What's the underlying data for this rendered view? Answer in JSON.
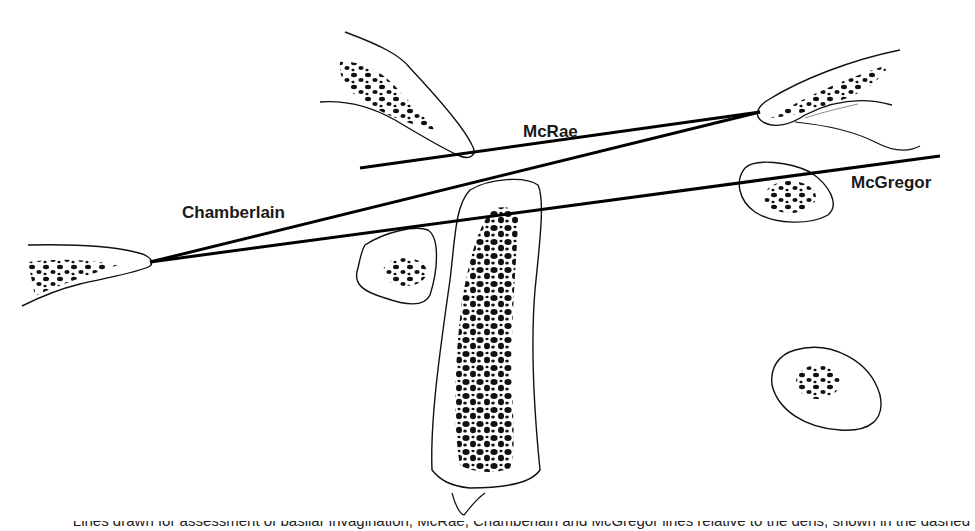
{
  "figure": {
    "type": "anatomical line diagram",
    "colors": {
      "ink": "#111111",
      "background": "#ffffff"
    }
  },
  "labels": {
    "mcrae": "McRae",
    "chamberlain": "Chamberlain",
    "mcgregor": "McGregor"
  },
  "lines": [
    {
      "name": "McRae",
      "x1": 360,
      "y1": 168,
      "x2": 760,
      "y2": 112
    },
    {
      "name": "Chamberlain",
      "x1": 150,
      "y1": 262,
      "x2": 760,
      "y2": 112
    },
    {
      "name": "McGregor",
      "x1": 150,
      "y1": 262,
      "x2": 940,
      "y2": 156
    }
  ],
  "caption": "Lines drawn for assessment of basilar invagination; McRae, Chamberlain and McGregor lines relative to the dens, shown in the dashed heads of the bony landmarks"
}
